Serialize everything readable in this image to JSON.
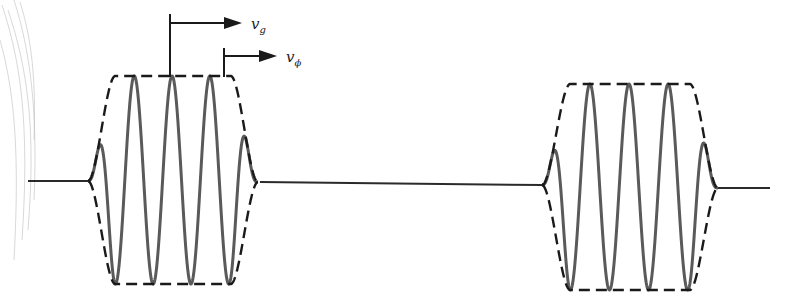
{
  "figure": {
    "labels": {
      "group_velocity": {
        "symbol": "v",
        "subscript": "g"
      },
      "phase_velocity": {
        "symbol": "v",
        "subscript": "ϕ"
      }
    },
    "packets": [
      {
        "name": "left-packet",
        "carrier_cycles": 4
      },
      {
        "name": "right-packet",
        "carrier_cycles": 4
      }
    ],
    "colors": {
      "carrier": "#5a5a5a",
      "envelope": "#1a1a1a",
      "baseline": "#2a2a2a"
    }
  }
}
